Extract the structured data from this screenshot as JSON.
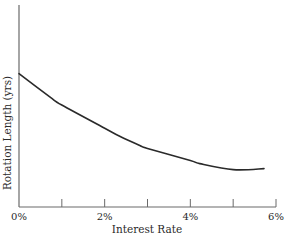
{
  "chart_data": {
    "type": "line",
    "title": "",
    "xlabel": "Interest Rate",
    "ylabel": "Rotation Length (yrs)",
    "x_ticks": [
      0,
      1,
      2,
      3,
      4,
      5,
      6
    ],
    "x_tick_labels": [
      "0%",
      "",
      "2%",
      "",
      "4%",
      "",
      "6%"
    ],
    "xlim": [
      0,
      6
    ],
    "y_ticks": [],
    "ylim": [
      0,
      100
    ],
    "y_units_note": "relative scale, no y tick values shown",
    "grid": false,
    "legend": null,
    "series": [
      {
        "name": "Rotation Length",
        "color": "#2a2a2a",
        "x": [
          0,
          0.72,
          1,
          2,
          2.35,
          2.82,
          3,
          4,
          4.22,
          5,
          5.72
        ],
        "y": [
          66,
          54.5,
          50.5,
          39,
          35,
          30.5,
          29,
          23,
          21.5,
          18.5,
          19
        ]
      }
    ]
  },
  "colors": {
    "axis": "#6a6a6a",
    "line": "#2a2a2a",
    "text": "#2a2a2a",
    "background": "#ffffff"
  }
}
